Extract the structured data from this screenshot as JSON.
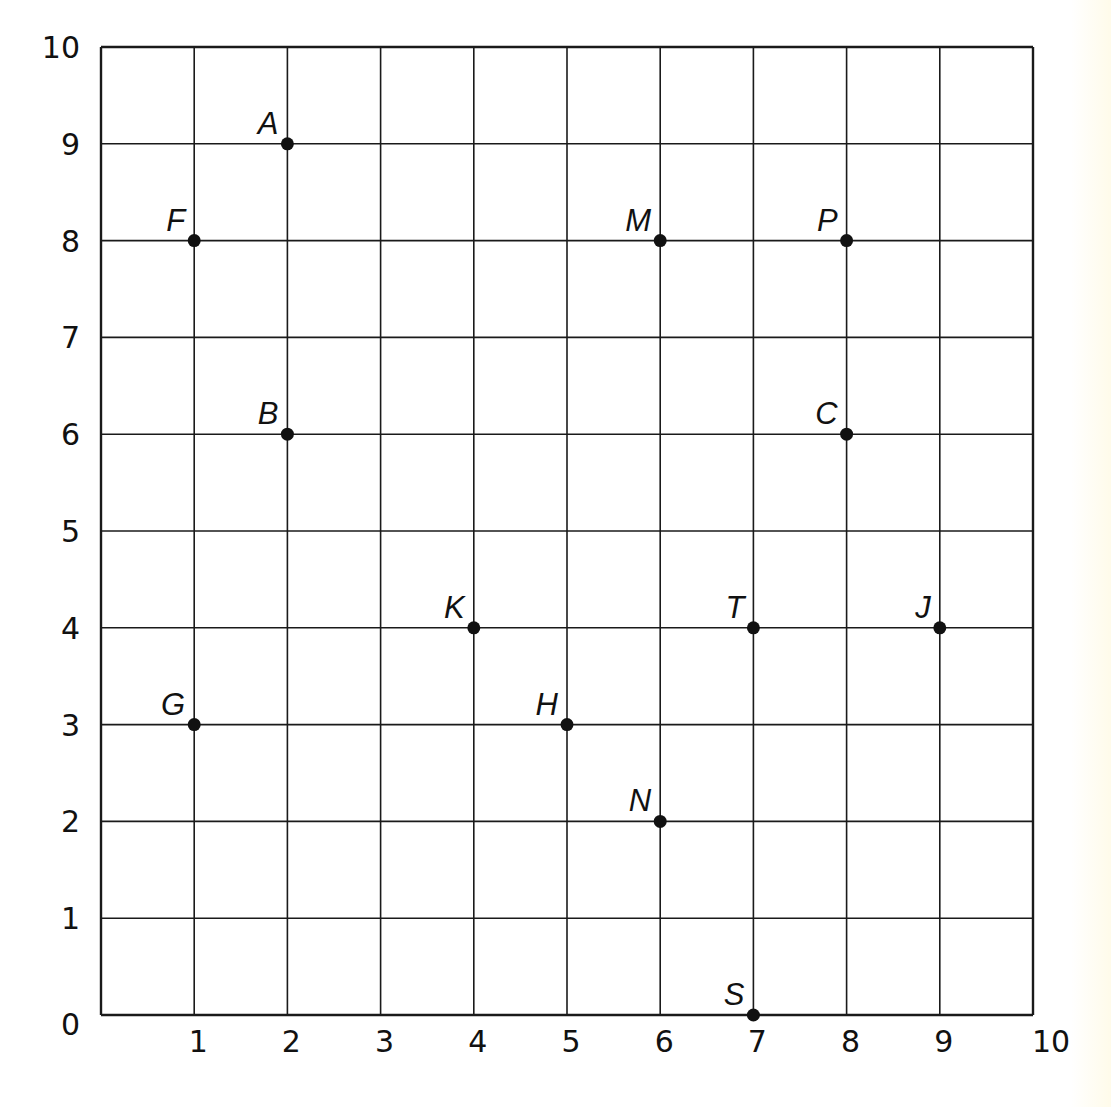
{
  "chart_data": {
    "type": "scatter",
    "title": "",
    "xlabel": "",
    "ylabel": "",
    "xlim": [
      0,
      10
    ],
    "ylim": [
      0,
      10
    ],
    "grid": true,
    "x_ticks": [
      "",
      "1",
      "2",
      "3",
      "4",
      "5",
      "6",
      "7",
      "8",
      "9",
      "10"
    ],
    "y_ticks": [
      "0",
      "1",
      "2",
      "3",
      "4",
      "5",
      "6",
      "7",
      "8",
      "9",
      "10"
    ],
    "origin_label": "0",
    "points": [
      {
        "label": "A",
        "x": 2,
        "y": 9
      },
      {
        "label": "F",
        "x": 1,
        "y": 8
      },
      {
        "label": "M",
        "x": 6,
        "y": 8
      },
      {
        "label": "P",
        "x": 8,
        "y": 8
      },
      {
        "label": "B",
        "x": 2,
        "y": 6
      },
      {
        "label": "C",
        "x": 8,
        "y": 6
      },
      {
        "label": "K",
        "x": 4,
        "y": 4
      },
      {
        "label": "T",
        "x": 7,
        "y": 4
      },
      {
        "label": "J",
        "x": 9,
        "y": 4
      },
      {
        "label": "G",
        "x": 1,
        "y": 3
      },
      {
        "label": "H",
        "x": 5,
        "y": 3
      },
      {
        "label": "N",
        "x": 6,
        "y": 2
      },
      {
        "label": "S",
        "x": 7,
        "y": 0
      }
    ]
  },
  "colors": {
    "line": "#1a1a1a",
    "point": "#111111",
    "background": "#ffffff"
  }
}
